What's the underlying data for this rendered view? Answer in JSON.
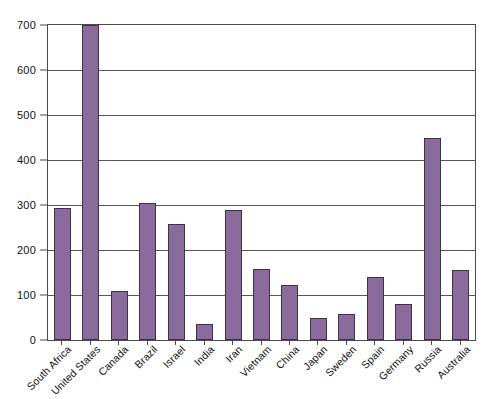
{
  "chart_data": {
    "type": "bar",
    "title": "",
    "subtitle": "",
    "xlabel": "",
    "ylabel": "",
    "categories": [
      "South Africa",
      "United States",
      "Canada",
      "Brazil",
      "Israel",
      "India",
      "Iran",
      "Vietnam",
      "China",
      "Japan",
      "Sweden",
      "Spain",
      "Germany",
      "Russia",
      "Australia"
    ],
    "values": [
      293,
      700,
      108,
      305,
      258,
      35,
      288,
      158,
      122,
      50,
      58,
      140,
      80,
      448,
      155
    ],
    "ylim": [
      0,
      700
    ],
    "ytick_labels": [
      "0",
      "100",
      "200",
      "300",
      "400",
      "500",
      "600",
      "700"
    ],
    "ytick_values": [
      0,
      100,
      200,
      300,
      400,
      500,
      600,
      700
    ],
    "grid": true,
    "grid_axis": "y",
    "legend": false,
    "legend_position": "none",
    "annotations": [],
    "colors": {
      "bar_fill": "#8b6b9d",
      "bar_border": "#3e3247",
      "gridline": "#555555",
      "axis_frame": "#4a4a4a",
      "background": "#ffffff",
      "text": "#111111"
    }
  }
}
